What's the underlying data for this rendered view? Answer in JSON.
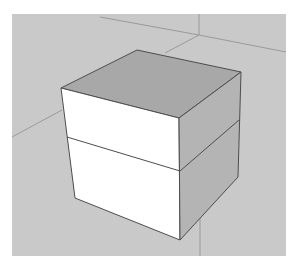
{
  "app": {
    "kind": "3d-modeling-viewport"
  },
  "viewport": {
    "background": "#c9c9c9",
    "axis_color": "#9a9a9a",
    "edge_color": "#4d4d4d"
  },
  "model": {
    "object": "box",
    "sections": 2,
    "faces": {
      "top": "#a8a8a8",
      "front": "#ffffff",
      "right": "#b4b4b4"
    }
  }
}
